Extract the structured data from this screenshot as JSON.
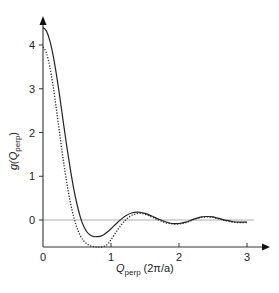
{
  "chart_data": {
    "type": "line",
    "title": "",
    "xlabel": "Q_perp (2π/a)",
    "ylabel": "g(Q_perp)",
    "xlabel_parts": {
      "main": "Q",
      "sub": "perp",
      "unit": "(2π/a)"
    },
    "ylabel_parts": {
      "main": "g(Q",
      "sub": "perp",
      "close": ")"
    },
    "xlim": [
      0,
      3.2
    ],
    "ylim": [
      -0.62,
      4.6
    ],
    "x_ticks": [
      0,
      1,
      2,
      3
    ],
    "x_tick_labels": [
      "0",
      "1",
      "2",
      "3"
    ],
    "y_ticks": [
      0,
      1,
      2,
      3,
      4
    ],
    "y_tick_labels": [
      "0",
      "1",
      "2",
      "3",
      "4"
    ],
    "grid": false,
    "reference_line": {
      "y": 0,
      "x_range": [
        0,
        3.1
      ],
      "color": "#999999"
    },
    "legend": null,
    "series": [
      {
        "name": "solid curve",
        "style": "solid",
        "color": "#222222",
        "x": [
          0,
          0.05,
          0.1,
          0.15,
          0.2,
          0.25,
          0.3,
          0.35,
          0.4,
          0.45,
          0.5,
          0.55,
          0.6,
          0.65,
          0.7,
          0.75,
          0.8,
          0.85,
          0.9,
          0.95,
          1.0,
          1.1,
          1.2,
          1.3,
          1.4,
          1.5,
          1.6,
          1.7,
          1.8,
          1.9,
          2.0,
          2.1,
          2.2,
          2.3,
          2.4,
          2.5,
          2.6,
          2.7,
          2.8,
          2.9,
          3.0
        ],
        "values": [
          4.4,
          4.32,
          4.1,
          3.75,
          3.3,
          2.78,
          2.22,
          1.68,
          1.18,
          0.73,
          0.36,
          0.06,
          -0.15,
          -0.28,
          -0.35,
          -0.38,
          -0.38,
          -0.37,
          -0.33,
          -0.27,
          -0.2,
          -0.05,
          0.08,
          0.16,
          0.18,
          0.15,
          0.09,
          0.02,
          -0.04,
          -0.08,
          -0.08,
          -0.05,
          0.01,
          0.06,
          0.08,
          0.07,
          0.03,
          -0.01,
          -0.04,
          -0.05,
          -0.05
        ]
      },
      {
        "name": "dotted curve",
        "style": "dotted",
        "color": "#222222",
        "x": [
          0,
          0.05,
          0.1,
          0.15,
          0.2,
          0.25,
          0.3,
          0.35,
          0.4,
          0.45,
          0.5,
          0.55,
          0.6,
          0.65,
          0.7,
          0.75,
          0.8,
          0.85,
          0.9,
          0.95,
          1.0,
          1.1,
          1.2,
          1.3,
          1.4,
          1.5,
          1.6,
          1.7,
          1.8,
          1.9,
          2.0,
          2.1,
          2.2,
          2.3,
          2.4,
          2.5,
          2.6,
          2.7,
          2.8,
          2.9,
          3.0
        ],
        "values": [
          3.95,
          3.82,
          3.5,
          3.05,
          2.5,
          1.92,
          1.35,
          0.85,
          0.42,
          0.08,
          -0.18,
          -0.36,
          -0.48,
          -0.55,
          -0.59,
          -0.61,
          -0.62,
          -0.62,
          -0.6,
          -0.55,
          -0.45,
          -0.22,
          -0.02,
          0.1,
          0.15,
          0.13,
          0.07,
          0.0,
          -0.06,
          -0.09,
          -0.09,
          -0.06,
          0.0,
          0.05,
          0.07,
          0.06,
          0.02,
          -0.02,
          -0.05,
          -0.06,
          -0.06
        ]
      }
    ]
  }
}
